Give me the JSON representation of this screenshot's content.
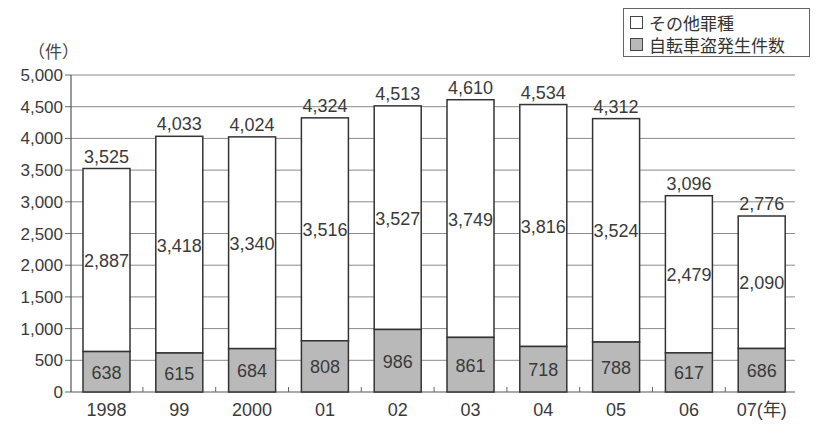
{
  "chart_data": {
    "type": "bar",
    "stacked": true,
    "title": "",
    "xlabel": "",
    "ylabel": "（件）",
    "x_unit_suffix": "(年)",
    "categories": [
      "1998",
      "99",
      "2000",
      "01",
      "02",
      "03",
      "04",
      "05",
      "06",
      "07"
    ],
    "series": [
      {
        "name": "自転車盗発生件数",
        "color": "#b9b9b9",
        "values": [
          638,
          615,
          684,
          808,
          986,
          861,
          718,
          788,
          617,
          686
        ]
      },
      {
        "name": "その他罪種",
        "color": "#ffffff",
        "values": [
          2887,
          3418,
          3340,
          3516,
          3527,
          3749,
          3816,
          3524,
          2479,
          2090
        ]
      }
    ],
    "totals": [
      3525,
      4033,
      4024,
      4324,
      4513,
      4610,
      4534,
      4312,
      3096,
      2776
    ],
    "ylim": [
      0,
      5000
    ],
    "yticks": [
      0,
      500,
      1000,
      1500,
      2000,
      2500,
      3000,
      3500,
      4000,
      4500,
      5000
    ],
    "ytick_labels": [
      "0",
      "500",
      "1,000",
      "1,500",
      "2,000",
      "2,500",
      "3,000",
      "3,500",
      "4,000",
      "4,500",
      "5,000"
    ],
    "grid": true,
    "legend_position": "top-right"
  },
  "legend": {
    "items": [
      {
        "label": "その他罪種",
        "swatch": "white"
      },
      {
        "label": "自転車盗発生件数",
        "swatch": "gray"
      }
    ]
  },
  "axis": {
    "y_unit": "（件）",
    "x_last_suffix": "(年)"
  }
}
